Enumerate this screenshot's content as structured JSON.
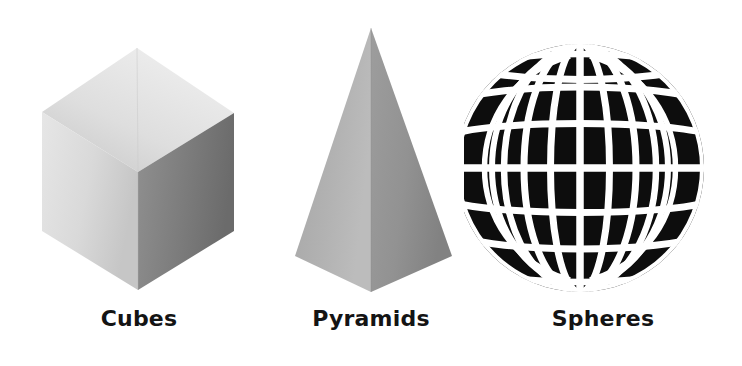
{
  "page": {
    "background_color": "#ffffff",
    "width": 742,
    "height": 366
  },
  "figures": [
    {
      "id": "cube",
      "label": "Cubes",
      "shape_name": "cube",
      "description": "Isometric gray cube with three visible faces",
      "colors": {
        "top_face_light": "#e8e8e8",
        "top_face_dark": "#c2c2c2",
        "left_face_light": "#e3e3e3",
        "left_face_dark": "#cfcfcf",
        "right_face_light": "#8a8a8a",
        "right_face_dark": "#6e6e6e"
      }
    },
    {
      "id": "pyramid",
      "label": "Pyramids",
      "shape_name": "square-pyramid",
      "description": "Tall gray square pyramid with two visible triangular faces",
      "colors": {
        "left_face_light": "#b4b4b4",
        "left_face_dark": "#9a9a9a",
        "right_face_light": "#9b9b9b",
        "right_face_dark": "#848484"
      }
    },
    {
      "id": "sphere",
      "label": "Spheres",
      "shape_name": "wireframe-sphere",
      "description": "Black sphere overlaid with a white latitude and longitude grid",
      "grid": {
        "meridians": 12,
        "parallels": 12,
        "line_color": "#ffffff",
        "fill_color": "#0d0d0d"
      }
    }
  ]
}
